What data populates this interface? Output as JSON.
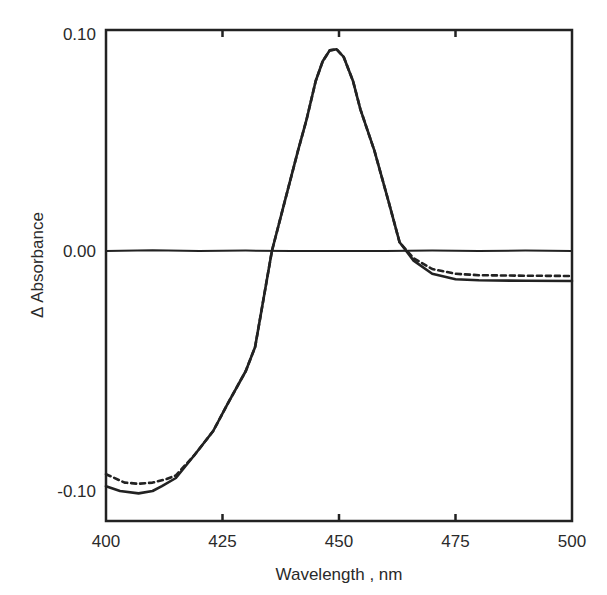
{
  "chart_data": {
    "type": "line",
    "title": "",
    "xlabel": "Wavelength , nm",
    "ylabel": "Δ Absorbance",
    "xlim": [
      400,
      500
    ],
    "ylim": [
      -0.113,
      0.1
    ],
    "xticks": [
      400,
      425,
      450,
      475,
      500
    ],
    "yticks": [
      {
        "value": 0.1,
        "label": "0.10"
      },
      {
        "value": 0.0,
        "label": "0.00"
      },
      {
        "value": -0.1,
        "label": "-0.10"
      }
    ],
    "grid": false,
    "legend": null,
    "series": [
      {
        "name": "baseline",
        "style": "solid",
        "x": [
          400,
          410,
          420,
          430,
          440,
          450,
          460,
          470,
          480,
          490,
          500
        ],
        "y": [
          0.0,
          0.0003,
          0.0,
          0.0002,
          0.0,
          0.0,
          0.0,
          0.0002,
          0.0,
          0.0002,
          0.0
        ]
      },
      {
        "name": "difference spectrum (solid)",
        "style": "solid",
        "x": [
          400,
          403,
          407,
          410,
          412,
          415,
          419,
          423,
          426,
          430,
          432,
          435.6,
          438.4,
          441.2,
          443,
          445,
          446.5,
          448,
          449.5,
          451,
          453,
          454.6,
          457.6,
          460.6,
          463,
          466,
          470,
          475,
          480,
          490,
          500
        ],
        "y": [
          -0.098,
          -0.1,
          -0.101,
          -0.1,
          -0.098,
          -0.0946,
          -0.085,
          -0.075,
          -0.064,
          -0.05,
          -0.04,
          0.0,
          0.023,
          0.046,
          0.06,
          0.078,
          0.087,
          0.092,
          0.0925,
          0.089,
          0.078,
          0.065,
          0.046,
          0.023,
          0.004,
          -0.004,
          -0.0095,
          -0.0118,
          -0.0122,
          -0.0124,
          -0.0125
        ]
      },
      {
        "name": "difference spectrum (dashed)",
        "style": "dashed",
        "x": [
          400,
          404,
          407,
          410,
          413,
          415,
          419,
          423,
          426,
          430,
          432,
          435.6,
          438.4,
          441.2,
          443,
          445,
          446.5,
          448,
          449.5,
          451,
          453,
          454.6,
          457.6,
          460.6,
          463,
          466,
          470,
          475,
          480,
          490,
          500
        ],
        "y": [
          -0.093,
          -0.0965,
          -0.097,
          -0.0965,
          -0.095,
          -0.0935,
          -0.085,
          -0.075,
          -0.064,
          -0.05,
          -0.04,
          0.0,
          0.023,
          0.046,
          0.06,
          0.078,
          0.087,
          0.092,
          0.0925,
          0.089,
          0.078,
          0.065,
          0.046,
          0.023,
          0.004,
          -0.003,
          -0.0075,
          -0.0095,
          -0.0101,
          -0.0103,
          -0.0104
        ]
      }
    ]
  }
}
